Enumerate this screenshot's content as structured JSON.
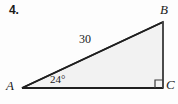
{
  "figure": {
    "problem_number": "4.",
    "type": "right-triangle-diagram",
    "background_color": "#fdfdfd",
    "stroke_color": "#2b2b2b",
    "fill_color": "#f2f2f2"
  },
  "labels": {
    "vertex_a": "A",
    "vertex_b": "B",
    "vertex_c": "C",
    "hypotenuse_length": "30",
    "angle_at_a": "24°"
  },
  "geometry": {
    "points": {
      "A": {
        "x": 22,
        "y": 88
      },
      "B": {
        "x": 163,
        "y": 22
      },
      "C": {
        "x": 163,
        "y": 88
      }
    },
    "right_angle_at": "C",
    "right_angle_marker_size": 8
  }
}
